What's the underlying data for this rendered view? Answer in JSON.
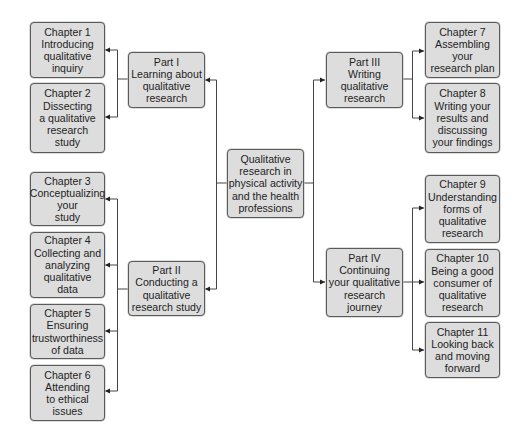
{
  "diagram": {
    "root": {
      "label": "Qualitative\nresearch in\nphysical activity\nand the health\nprofessions"
    },
    "parts": [
      {
        "label": "Part I\nLearning about\nqualitative\nresearch"
      },
      {
        "label": "Part II\nConducting a\nqualitative\nresearch study"
      },
      {
        "label": "Part III\nWriting\nqualitative\nresearch"
      },
      {
        "label": "Part IV\nContinuing\nyour qualitative\nresearch\njourney"
      }
    ],
    "chapters": [
      {
        "label": "Chapter 1\nIntroducing\nqualitative\ninquiry"
      },
      {
        "label": "Chapter 2\nDissecting\na qualitative\nresearch\nstudy"
      },
      {
        "label": "Chapter 3\nConceptualizing\nyour\nstudy"
      },
      {
        "label": "Chapter 4\nCollecting and\nanalyzing\nqualitative\ndata"
      },
      {
        "label": "Chapter 5\nEnsuring\ntrustworthiness\nof data"
      },
      {
        "label": "Chapter 6\nAttending\nto ethical\nissues"
      },
      {
        "label": "Chapter 7\nAssembling\nyour\nresearch plan"
      },
      {
        "label": "Chapter 8\nWriting your\nresults and\ndiscussing\nyour findings"
      },
      {
        "label": "Chapter 9\nUnderstanding\nforms of\nqualitative\nresearch"
      },
      {
        "label": "Chapter 10\nBeing a good\nconsumer of\nqualitative\nresearch"
      },
      {
        "label": "Chapter 11\nLooking back\nand moving\nforward"
      }
    ],
    "colors": {
      "box_fill": "#dddddd",
      "box_border": "#5a5a5a",
      "line": "#333333"
    }
  }
}
